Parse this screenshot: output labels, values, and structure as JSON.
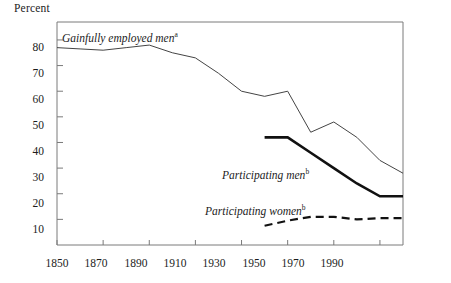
{
  "chart_data": {
    "type": "line",
    "title": "",
    "ylabel": "Percent",
    "xlabel": "",
    "xlim": [
      1850,
      2000
    ],
    "ylim": [
      0,
      87
    ],
    "grid": false,
    "legend_position": "inline-annotations",
    "yticks": [
      10,
      20,
      30,
      40,
      50,
      60,
      70,
      80
    ],
    "xticks": [
      1850,
      1870,
      1890,
      1910,
      1930,
      1950,
      1970,
      1990
    ],
    "ytick_labels": [
      "10",
      "20",
      "30",
      "40",
      "50",
      "60",
      "70",
      "80"
    ],
    "xtick_labels": [
      "1850",
      "1870",
      "1890",
      "1910",
      "1930",
      "1950",
      "1970",
      "1990"
    ],
    "series": [
      {
        "name": "Gainfully employed men",
        "footnote": "a",
        "style": "thin-solid",
        "color": "#444444",
        "x": [
          1850,
          1860,
          1870,
          1880,
          1890,
          1900,
          1910,
          1920,
          1930,
          1940,
          1950,
          1960,
          1970,
          1980,
          1990,
          2000
        ],
        "values": [
          77,
          76.5,
          76,
          77,
          78,
          75,
          73,
          67,
          60,
          58,
          60,
          44,
          48,
          42,
          33,
          28
        ]
      },
      {
        "name": "Participating men",
        "footnote": "b",
        "style": "thick-solid",
        "color": "#111111",
        "x": [
          1940,
          1950,
          1960,
          1970,
          1980,
          1990,
          2000
        ],
        "values": [
          42,
          42,
          36,
          30,
          24,
          19,
          19
        ]
      },
      {
        "name": "Participating women",
        "footnote": "b",
        "style": "dashed",
        "color": "#111111",
        "x": [
          1940,
          1950,
          1960,
          1970,
          1980,
          1990,
          2000
        ],
        "values": [
          7.5,
          9.5,
          11,
          11,
          10,
          10.5,
          10.5
        ]
      }
    ],
    "annotations": [
      {
        "text": "Gainfully employed men",
        "footnote": "a",
        "x_px": 62,
        "y_px": 33
      },
      {
        "text": "Participating men",
        "footnote": "b",
        "x_px": 222,
        "y_px": 170
      },
      {
        "text": "Participating women",
        "footnote": "b",
        "x_px": 205,
        "y_px": 206
      }
    ]
  },
  "ylabel_title": "Percent"
}
